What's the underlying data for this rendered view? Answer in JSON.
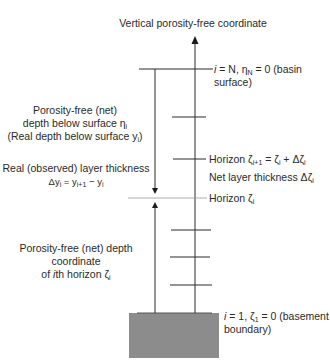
{
  "diagram": {
    "title": "Vertical porosity-free coordinate",
    "top_label": {
      "line1_prefix": "i",
      "line1_rest": " = N, η",
      "line1_sub": "N",
      "line1_tail": " = 0 (basin",
      "line2": "surface)"
    },
    "left_upper_label": {
      "line1": "Porosity-free (net)",
      "line2": "depth below surface η",
      "line2_sub": "i",
      "line3": "(Real depth below surface y",
      "line3_sub": "i",
      "line3_tail": ")"
    },
    "real_thickness_label": {
      "line1": "Real (observed) layer thickness",
      "line2": "Δy",
      "line2_sub1": "i",
      "line2_mid": " = y",
      "line2_sub2": "i+1",
      "line2_mid2": " − y",
      "line2_sub3": "i"
    },
    "horizon_next_label": {
      "text": "Horizon ζ",
      "sub1": "i+1",
      "mid": " = ζ",
      "sub2": "i",
      "mid2": " + Δζ",
      "sub3": "i"
    },
    "net_thickness_label": {
      "text": "Net layer thickness Δζ",
      "sub": "i"
    },
    "horizon_label": {
      "text": "Horizon ζ",
      "sub": "i"
    },
    "left_lower_label": {
      "line1": "Porosity-free (net) depth",
      "line2": "coordinate",
      "line3_pre": "of ",
      "line3_i": "i",
      "line3_rest": "th horizon ζ",
      "line3_sub": "i"
    },
    "bottom_label": {
      "line1_prefix": "i",
      "line1_rest": " = 1, ζ",
      "line1_sub": "1",
      "line1_tail": " = 0 (basement",
      "line2": "boundary)"
    },
    "colors": {
      "line": "#2a2a2a",
      "thin_line": "#9a9a9a",
      "basement_fill": "#8c8c8c"
    }
  }
}
